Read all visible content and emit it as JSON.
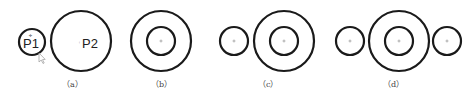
{
  "figure": {
    "panels": [
      {
        "label": "（a）",
        "circles": [
          {
            "id": "P1",
            "cx": 32,
            "cy": 42,
            "r": 13,
            "text": "P1"
          },
          {
            "id": "P2",
            "cx": 81,
            "cy": 41,
            "r": 30,
            "text": "P2"
          }
        ],
        "cursor": {
          "x": 40,
          "y": 56
        }
      },
      {
        "label": "（b）",
        "circles": [
          {
            "cx": 161,
            "cy": 41,
            "r": 30
          },
          {
            "cx": 161,
            "cy": 41,
            "r": 14
          }
        ]
      },
      {
        "label": "（c）",
        "circles": [
          {
            "cx": 234,
            "cy": 41,
            "r": 14
          },
          {
            "cx": 284,
            "cy": 41,
            "r": 30
          },
          {
            "cx": 284,
            "cy": 41,
            "r": 14
          }
        ]
      },
      {
        "label": "（d）",
        "circles": [
          {
            "cx": 350,
            "cy": 41,
            "r": 14
          },
          {
            "cx": 399,
            "cy": 41,
            "r": 30
          },
          {
            "cx": 399,
            "cy": 41,
            "r": 14
          },
          {
            "cx": 447,
            "cy": 41,
            "r": 14
          }
        ]
      }
    ],
    "label_positions": [
      72,
      161,
      284,
      399
    ],
    "colors": {
      "stroke": "#1a1a1a",
      "label": "#444444",
      "center_mark": "#888888"
    }
  }
}
